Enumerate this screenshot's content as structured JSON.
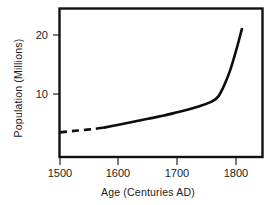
{
  "chart_data": {
    "type": "line",
    "title": "",
    "xlabel": "Age (Centuries AD)",
    "ylabel": "Population (Millions)",
    "xlim": [
      1500,
      1850
    ],
    "ylim": [
      0,
      24
    ],
    "grid": false,
    "legend": null,
    "xticks": [
      1500,
      1600,
      1700,
      1800
    ],
    "xtick_labels": [
      "1500",
      "1600",
      "1700",
      "1800"
    ],
    "yticks": [
      10,
      20
    ],
    "ytick_labels": [
      "10",
      "20"
    ],
    "series": [
      {
        "name": "Population",
        "style": "dashed",
        "note": "estimated early period",
        "x": [
          1500,
          1520,
          1540,
          1560,
          1575
        ],
        "values": [
          3.5,
          3.7,
          3.9,
          4.1,
          4.3
        ]
      },
      {
        "name": "Population",
        "style": "solid",
        "note": "recorded period",
        "x": [
          1575,
          1600,
          1625,
          1650,
          1675,
          1700,
          1720,
          1740,
          1760,
          1770,
          1780,
          1790,
          1800,
          1810
        ],
        "values": [
          4.3,
          4.8,
          5.3,
          5.8,
          6.3,
          6.9,
          7.4,
          8.0,
          8.8,
          9.6,
          11.5,
          14.0,
          17.3,
          21.0
        ]
      }
    ]
  },
  "axis": {
    "y_label": "Population (Millions)",
    "x_label": "Age (Centuries AD)"
  }
}
